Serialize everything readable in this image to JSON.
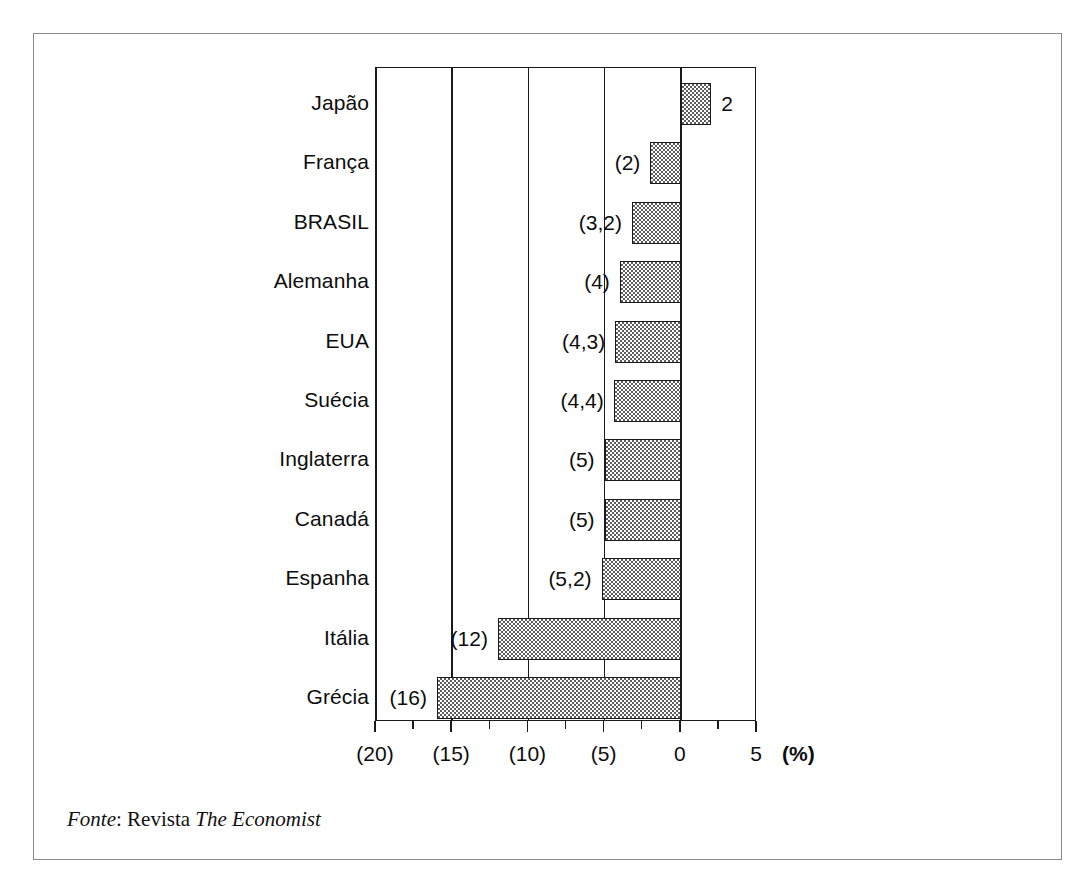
{
  "chart_data": {
    "type": "bar",
    "orientation": "horizontal",
    "title": "",
    "subtitle": "",
    "xlabel": "(%)",
    "ylabel": "",
    "xlim": [
      -20,
      5
    ],
    "grid": true,
    "legend": null,
    "categories": [
      "Japão",
      "França",
      "BRASIL",
      "Alemanha",
      "EUA",
      "Suécia",
      "Inglaterra",
      "Canadá",
      "Espanha",
      "Itália",
      "Grécia"
    ],
    "values": [
      2,
      -2,
      -3.2,
      -4,
      -4.3,
      -4.4,
      -5,
      -5,
      -5.2,
      -12,
      -16
    ],
    "value_labels": [
      "2",
      "(2)",
      "(3,2)",
      "(4)",
      "(4,3)",
      "(4,4)",
      "(5)",
      "(5)",
      "(5,2)",
      "(12)",
      "(16)"
    ],
    "xticks": [
      -20,
      -15,
      -10,
      -5,
      0,
      5
    ],
    "xtick_labels": [
      "(20)",
      "(15)",
      "(10)",
      "(5)",
      "0",
      "5"
    ],
    "xminor_ticks": [
      -17.5,
      -12.5,
      -7.5,
      -2.5,
      2.5
    ],
    "unit_label": "(%)",
    "bar_fill": "#5e5e5e",
    "bar_edge": "#1a1a1a",
    "axis_color": "#1a1a1a"
  },
  "source": {
    "label": "Fonte",
    "separator": ": ",
    "publisher": "Revista ",
    "publication": "The Economist",
    "full_text": "Fonte: Revista The Economist"
  },
  "frame": {
    "border_color": "#8a8a8a"
  }
}
